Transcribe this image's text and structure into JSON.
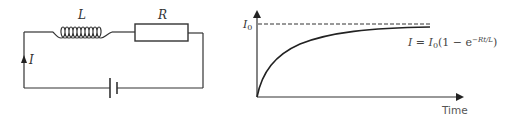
{
  "circuit": {
    "inductor_label": "L",
    "resistor_label": "R",
    "current_label": "I",
    "components": [
      "inductor",
      "resistor",
      "cell"
    ]
  },
  "graph": {
    "y_max_label": "I",
    "y_max_sub": "0",
    "x_axis_label": "Time",
    "equation": {
      "lhs": "I",
      "equals": " = ",
      "i0": "I",
      "i0_sub": "0",
      "body": "(1 − e",
      "exponent": "−Rt/L",
      "close": ")"
    }
  },
  "colors": {
    "line": "#333333",
    "text": "#444444"
  }
}
